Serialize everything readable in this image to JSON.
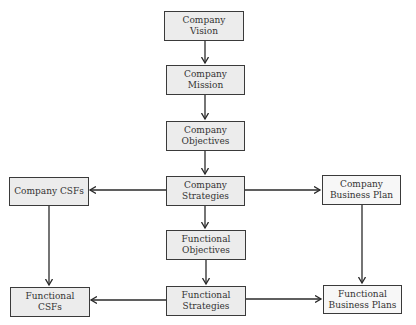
{
  "diagram": {
    "nodes": {
      "company_vision": "Company Vision",
      "company_mission": "Company Mission",
      "company_objectives": "Company Objectives",
      "company_strategies": "Company Strategies",
      "company_csfs": "Company CSFs",
      "company_business_plan": "Company Business Plan",
      "functional_objectives": "Functional Objectives",
      "functional_strategies": "Functional Strategies",
      "functional_csfs": "Functional CSFs",
      "functional_business_plans": "Functional Business Plans"
    },
    "edges": [
      {
        "from": "Company Vision",
        "to": "Company Mission"
      },
      {
        "from": "Company Mission",
        "to": "Company Objectives"
      },
      {
        "from": "Company Objectives",
        "to": "Company Strategies"
      },
      {
        "from": "Company Strategies",
        "to": "Company CSFs"
      },
      {
        "from": "Company Strategies",
        "to": "Company Business Plan"
      },
      {
        "from": "Company Strategies",
        "to": "Functional Objectives"
      },
      {
        "from": "Functional Objectives",
        "to": "Functional Strategies"
      },
      {
        "from": "Company CSFs",
        "to": "Functional CSFs"
      },
      {
        "from": "Company Business Plan",
        "to": "Functional Business Plans"
      },
      {
        "from": "Functional Strategies",
        "to": "Functional CSFs"
      },
      {
        "from": "Functional Strategies",
        "to": "Functional Business Plans"
      }
    ],
    "colors": {
      "box_fill": "#ececec",
      "box_border": "#3a3a3a",
      "arrow": "#2a2a2a",
      "text": "#333333"
    }
  }
}
